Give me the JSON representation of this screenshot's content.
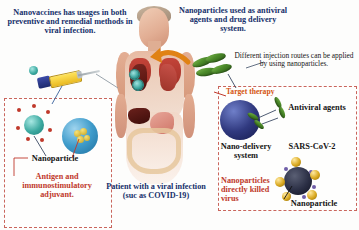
{
  "figure": {
    "colors": {
      "navy_text": "#16306b",
      "red_text": "#c0392b",
      "orange_text": "#d4540f",
      "dark_text": "#151515",
      "panel_border": "#c9655c",
      "arrow": "#e08214",
      "capsule_green": "#4c8b2a",
      "nano_navy": "#30397f",
      "gold_nanoparticle": "#d9a81f"
    }
  },
  "captions": {
    "top_left": "Nanovaccines has usages in both preventive and remedial methods in viral infection.",
    "top_center": "Nanoparticles used as antiviral agents and drug delivery system.",
    "right_injection": "Different injection routes can be applied by using nanoparticles.",
    "bottom_center": "Patient with a viral infection (suc as COVID-19)",
    "bottom_right_red": "Nanoparticles directly killed virus"
  },
  "labels": {
    "nanoparticle_left": "Nanoparticle",
    "antigen_adjuvant": "Antigen and immunostimulatory adjuvant.",
    "target_therapy": "Target therapy",
    "antiviral_agents": "Antiviral agents",
    "nano_delivery_system": "Nano-delivery system",
    "sars_cov_2": "SARS-CoV-2",
    "nanoparticle_right": "Nanoparticle"
  },
  "panels": [
    {
      "name": "nanovaccine-panel",
      "position": "bottom-left"
    },
    {
      "name": "antiviral-panel",
      "position": "right"
    }
  ],
  "illustrations": [
    {
      "name": "patient-body",
      "description": "human torso with lungs and abdominal organs"
    },
    {
      "name": "syringe",
      "description": "yellow syringe with blue plunger"
    },
    {
      "name": "green-capsules",
      "description": "four green capsule nanoparticles"
    },
    {
      "name": "teal-nanoparticle",
      "description": "teal nanoparticle with red surface antigens"
    },
    {
      "name": "blue-nanoparticle",
      "description": "blue nanoparticle encapsulating adjuvant"
    },
    {
      "name": "navy-nanocarrier",
      "description": "navy nano-delivery sphere"
    },
    {
      "name": "sars-cov-2-virus",
      "description": "virus particle bound by gold nanoparticles"
    }
  ]
}
